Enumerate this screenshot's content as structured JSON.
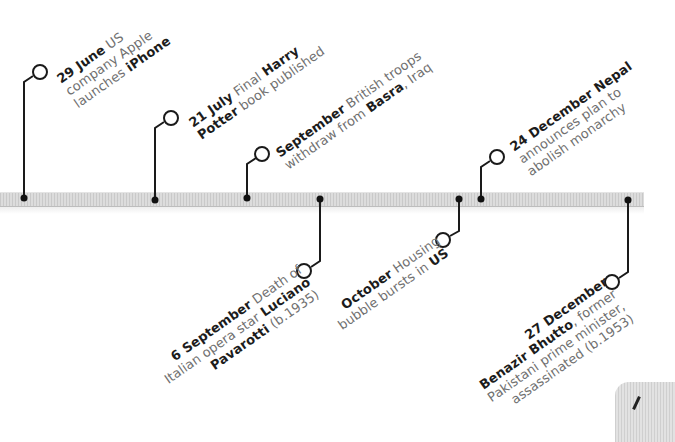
{
  "timeline": {
    "axis_colors": {
      "bar": "#d4d4d4",
      "stroke": "#1a1a1a",
      "date_text": "#1c1c1c",
      "body_text": "#707070"
    },
    "events": [
      {
        "id": "e1",
        "position": "above",
        "date": "29 June",
        "lines": [
          [
            {
              "t": "29 June",
              "b": true
            },
            {
              "t": " US",
              "b": false
            }
          ],
          [
            {
              "t": "company Apple",
              "b": false
            }
          ],
          [
            {
              "t": "launches ",
              "b": false
            },
            {
              "t": "iPhone",
              "b": true
            }
          ]
        ]
      },
      {
        "id": "e2",
        "position": "above",
        "date": "21 July",
        "lines": [
          [
            {
              "t": "21 July",
              "b": true
            },
            {
              "t": " Final ",
              "b": false
            },
            {
              "t": "Harry",
              "b": true
            }
          ],
          [
            {
              "t": "Potter",
              "b": true
            },
            {
              "t": " book published",
              "b": false
            }
          ]
        ]
      },
      {
        "id": "e3",
        "position": "above",
        "date": "September",
        "lines": [
          [
            {
              "t": "September",
              "b": true
            },
            {
              "t": " British troops",
              "b": false
            }
          ],
          [
            {
              "t": "withdraw from ",
              "b": false
            },
            {
              "t": "Basra",
              "b": true
            },
            {
              "t": ", Iraq",
              "b": false
            }
          ]
        ]
      },
      {
        "id": "e4",
        "position": "below",
        "date": "6 September",
        "lines": [
          [
            {
              "t": "6 September",
              "b": true
            },
            {
              "t": " Death of",
              "b": false
            }
          ],
          [
            {
              "t": "Italian opera star ",
              "b": false
            },
            {
              "t": "Luciano",
              "b": true
            }
          ],
          [
            {
              "t": "Pavarotti",
              "b": true
            },
            {
              "t": " (b.1935)",
              "b": false
            }
          ]
        ]
      },
      {
        "id": "e5",
        "position": "below",
        "date": "October",
        "lines": [
          [
            {
              "t": "October",
              "b": true
            },
            {
              "t": " Housing",
              "b": false
            }
          ],
          [
            {
              "t": "bubble bursts in ",
              "b": false
            },
            {
              "t": "US",
              "b": true
            }
          ]
        ]
      },
      {
        "id": "e6",
        "position": "above",
        "date": "24 December",
        "lines": [
          [
            {
              "t": "24 December",
              "b": true
            },
            {
              "t": " Nepal",
              "b": true
            }
          ],
          [
            {
              "t": "announces plan to",
              "b": false
            }
          ],
          [
            {
              "t": "abolish monarchy",
              "b": false
            }
          ]
        ]
      },
      {
        "id": "e7",
        "position": "below",
        "date": "27 December",
        "lines": [
          [
            {
              "t": "27 December",
              "b": true
            }
          ],
          [
            {
              "t": "Benazir Bhutto",
              "b": true
            },
            {
              "t": ", former",
              "b": false
            }
          ],
          [
            {
              "t": "Pakistani prime minister,",
              "b": false
            }
          ],
          [
            {
              "t": "assassinated (b.1953)",
              "b": false
            }
          ]
        ]
      }
    ]
  }
}
